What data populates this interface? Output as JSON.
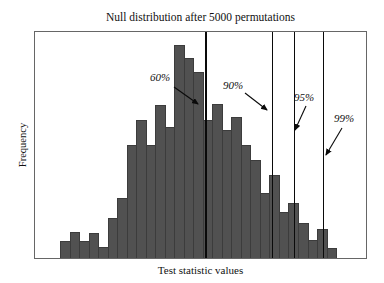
{
  "figure": {
    "title": "Null distribution after 5000 permutations",
    "xlabel": "Test statistic values",
    "ylabel": "Frequency"
  },
  "colors": {
    "bar_fill": "#515151",
    "bar_edge": "#3c3c3c",
    "axis_box": "#666666",
    "percentile_line": "#0a0a0a",
    "text": "#111111",
    "background": "#ffffff"
  },
  "chart_data": {
    "type": "bar",
    "subtype": "histogram",
    "title": "Null distribution after 5000 permutations",
    "xlabel": "Test statistic values",
    "ylabel": "Frequency",
    "grid": false,
    "legend": "none",
    "axis_tick_labels": "none visible on either axis",
    "plot_rect_px": {
      "left": 34,
      "top": 31,
      "width": 333,
      "height": 228
    },
    "bins": {
      "count": 29,
      "x_min_px": 59,
      "bin_width_px": 9.52,
      "heights_px": [
        17,
        26,
        17,
        25,
        11,
        40,
        60,
        113,
        138,
        113,
        153,
        131,
        213,
        200,
        186,
        138,
        154,
        128,
        141,
        113,
        98,
        65,
        83,
        46,
        55,
        35,
        18,
        29,
        10
      ],
      "max_height_px": 213,
      "units": "frequency in arbitrary units (pixel-proportional, no numeric axis shown)"
    },
    "percentile_lines": [
      {
        "label": "60%",
        "x_px": 204.5,
        "width_px": 2
      },
      {
        "label": "90%",
        "x_px": 271.5,
        "width_px": 1.5
      },
      {
        "label": "95%",
        "x_px": 293.5,
        "width_px": 1.5
      },
      {
        "label": "99%",
        "x_px": 322.5,
        "width_px": 1.5
      }
    ]
  }
}
